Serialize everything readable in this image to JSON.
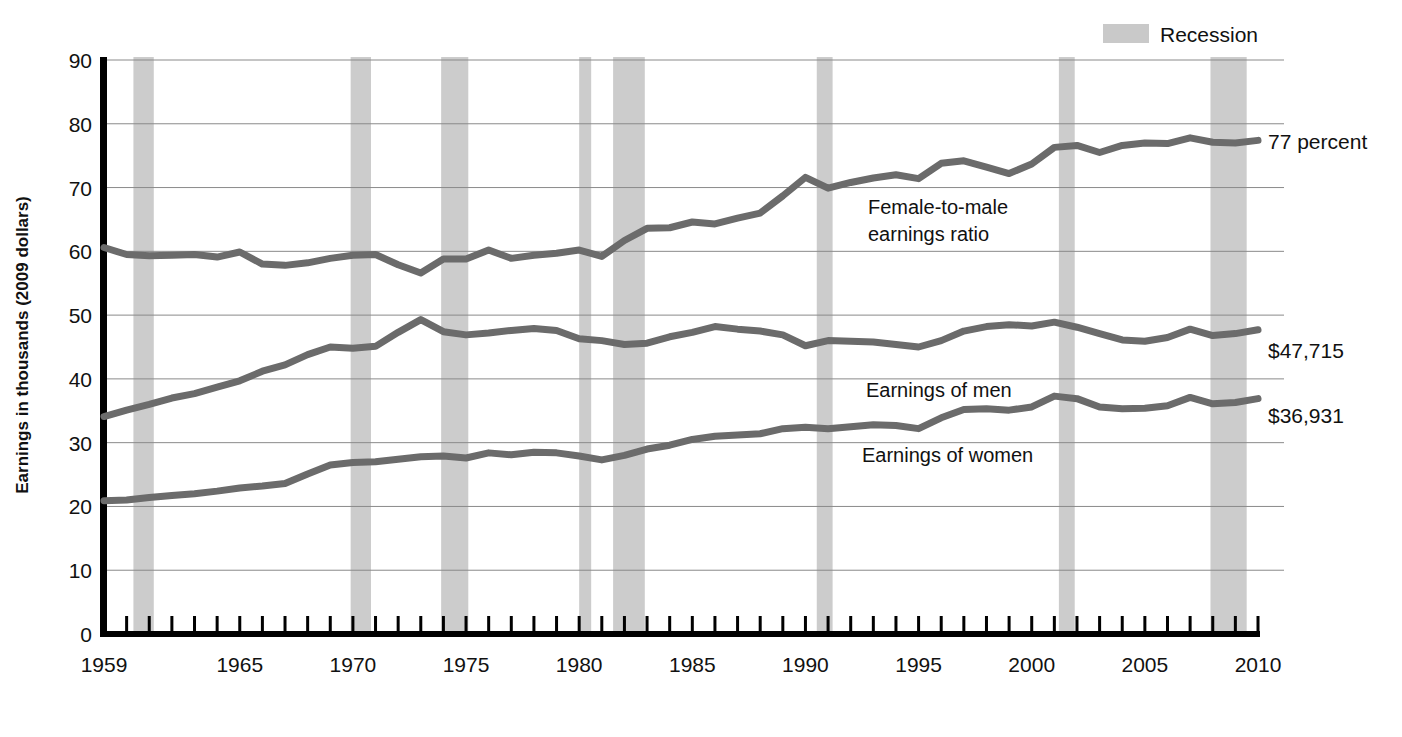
{
  "figure": {
    "legend": {
      "label": "Recession",
      "swatch_color": "#c9c9c9"
    },
    "axis_title_y": "Earnings in thousands (2009 dollars)",
    "annotations": {
      "ratio": "Female-to-male\nearnings ratio",
      "ratio_line1": "Female-to-male",
      "ratio_line2": "earnings ratio",
      "men": "Earnings of men",
      "women": "Earnings of women"
    },
    "end_labels": {
      "ratio": "77 percent",
      "men": "$47,715",
      "women": "$36,931"
    },
    "colors": {
      "line": "#6b6b6b",
      "recession_band": "#cccccc",
      "gridline": "#8a8a8a",
      "axis": "#000000"
    }
  },
  "chart_data": {
    "type": "line",
    "title": "",
    "xlabel": "",
    "ylabel": "Earnings in thousands (2009 dollars)",
    "xlim": [
      1959,
      2010
    ],
    "ylim": [
      0,
      90
    ],
    "ytick_labels": [
      "0",
      "10",
      "20",
      "30",
      "40",
      "50",
      "60",
      "70",
      "80",
      "90"
    ],
    "yticks": [
      0,
      10,
      20,
      30,
      40,
      50,
      60,
      70,
      80,
      90
    ],
    "xtick_labels": [
      "1959",
      "1965",
      "1970",
      "1975",
      "1980",
      "1985",
      "1990",
      "1995",
      "2000",
      "2005",
      "2010"
    ],
    "xticks": [
      1959,
      1965,
      1970,
      1975,
      1980,
      1985,
      1990,
      1995,
      2000,
      2005,
      2010
    ],
    "minor_xticks_every": 1,
    "grid": "horizontal",
    "legend_position": "top-right",
    "x": [
      1959,
      1960,
      1961,
      1962,
      1963,
      1964,
      1965,
      1966,
      1967,
      1968,
      1969,
      1970,
      1971,
      1972,
      1973,
      1974,
      1975,
      1976,
      1977,
      1978,
      1979,
      1980,
      1981,
      1982,
      1983,
      1984,
      1985,
      1986,
      1987,
      1988,
      1989,
      1990,
      1991,
      1992,
      1993,
      1994,
      1995,
      1996,
      1997,
      1998,
      1999,
      2000,
      2001,
      2002,
      2003,
      2004,
      2005,
      2006,
      2007,
      2008,
      2009,
      2010
    ],
    "series": [
      {
        "name": "Female-to-male earnings ratio",
        "unit": "percent",
        "axis": "left-scaled-as-thousands",
        "end_label": "77 percent",
        "values": [
          60.6,
          59.5,
          59.3,
          59.4,
          59.5,
          59.1,
          59.9,
          58.0,
          57.8,
          58.2,
          58.9,
          59.4,
          59.5,
          57.9,
          56.6,
          58.8,
          58.8,
          60.2,
          58.9,
          59.4,
          59.7,
          60.2,
          59.2,
          61.7,
          63.6,
          63.7,
          64.6,
          64.3,
          65.2,
          66.0,
          68.7,
          71.6,
          69.9,
          70.8,
          71.5,
          72.0,
          71.4,
          73.8,
          74.2,
          73.2,
          72.2,
          73.7,
          76.3,
          76.6,
          75.5,
          76.6,
          77.0,
          76.9,
          77.8,
          77.1,
          77.0,
          77.4
        ]
      },
      {
        "name": "Earnings of men",
        "unit": "thousands of 2009 dollars",
        "end_label": "$47,715",
        "values": [
          34.1,
          35.1,
          36.0,
          37.0,
          37.7,
          38.7,
          39.7,
          41.2,
          42.2,
          43.8,
          45.0,
          44.8,
          45.1,
          47.3,
          49.3,
          47.4,
          46.9,
          47.2,
          47.6,
          47.9,
          47.6,
          46.3,
          46.0,
          45.4,
          45.6,
          46.6,
          47.3,
          48.2,
          47.8,
          47.5,
          46.9,
          45.2,
          46.0,
          45.9,
          45.8,
          45.4,
          45.0,
          46.0,
          47.5,
          48.2,
          48.5,
          48.3,
          48.9,
          48.1,
          47.1,
          46.1,
          45.9,
          46.5,
          47.8,
          46.8,
          47.1,
          47.7
        ]
      },
      {
        "name": "Earnings of women",
        "unit": "thousands of 2009 dollars",
        "end_label": "$36,931",
        "values": [
          20.9,
          21.0,
          21.4,
          21.7,
          22.0,
          22.4,
          22.9,
          23.2,
          23.6,
          25.1,
          26.5,
          26.9,
          27.0,
          27.4,
          27.8,
          27.9,
          27.6,
          28.4,
          28.1,
          28.5,
          28.4,
          27.9,
          27.3,
          28.0,
          29.0,
          29.6,
          30.5,
          31.0,
          31.2,
          31.4,
          32.2,
          32.4,
          32.2,
          32.5,
          32.8,
          32.7,
          32.2,
          33.9,
          35.2,
          35.3,
          35.1,
          35.6,
          37.3,
          36.9,
          35.6,
          35.3,
          35.4,
          35.8,
          37.1,
          36.1,
          36.3,
          36.9
        ]
      }
    ],
    "recessions": [
      {
        "start": 1960.3,
        "end": 1961.2
      },
      {
        "start": 1969.9,
        "end": 1970.8
      },
      {
        "start": 1973.9,
        "end": 1975.1
      },
      {
        "start": 1980.0,
        "end": 1980.5
      },
      {
        "start": 1981.5,
        "end": 1982.9
      },
      {
        "start": 1990.5,
        "end": 1991.2
      },
      {
        "start": 2001.2,
        "end": 2001.9
      },
      {
        "start": 2007.9,
        "end": 2009.5
      }
    ]
  }
}
